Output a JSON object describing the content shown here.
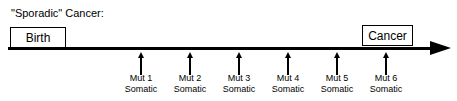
{
  "diagram": {
    "title": "\"Sporadic\" Cancer:",
    "start_label": "Birth",
    "end_label": "Cancer",
    "axis_color": "#000000",
    "background_color": "#ffffff",
    "markers": [
      {
        "name": "Mut 1",
        "type": "Somatic",
        "x": 141
      },
      {
        "name": "Mut 2",
        "type": "Somatic",
        "x": 190
      },
      {
        "name": "Mut 3",
        "type": "Somatic",
        "x": 239
      },
      {
        "name": "Mut 4",
        "type": "Somatic",
        "x": 288
      },
      {
        "name": "Mut 5",
        "type": "Somatic",
        "x": 337
      },
      {
        "name": "Mut 6",
        "type": "Somatic",
        "x": 386
      }
    ]
  }
}
